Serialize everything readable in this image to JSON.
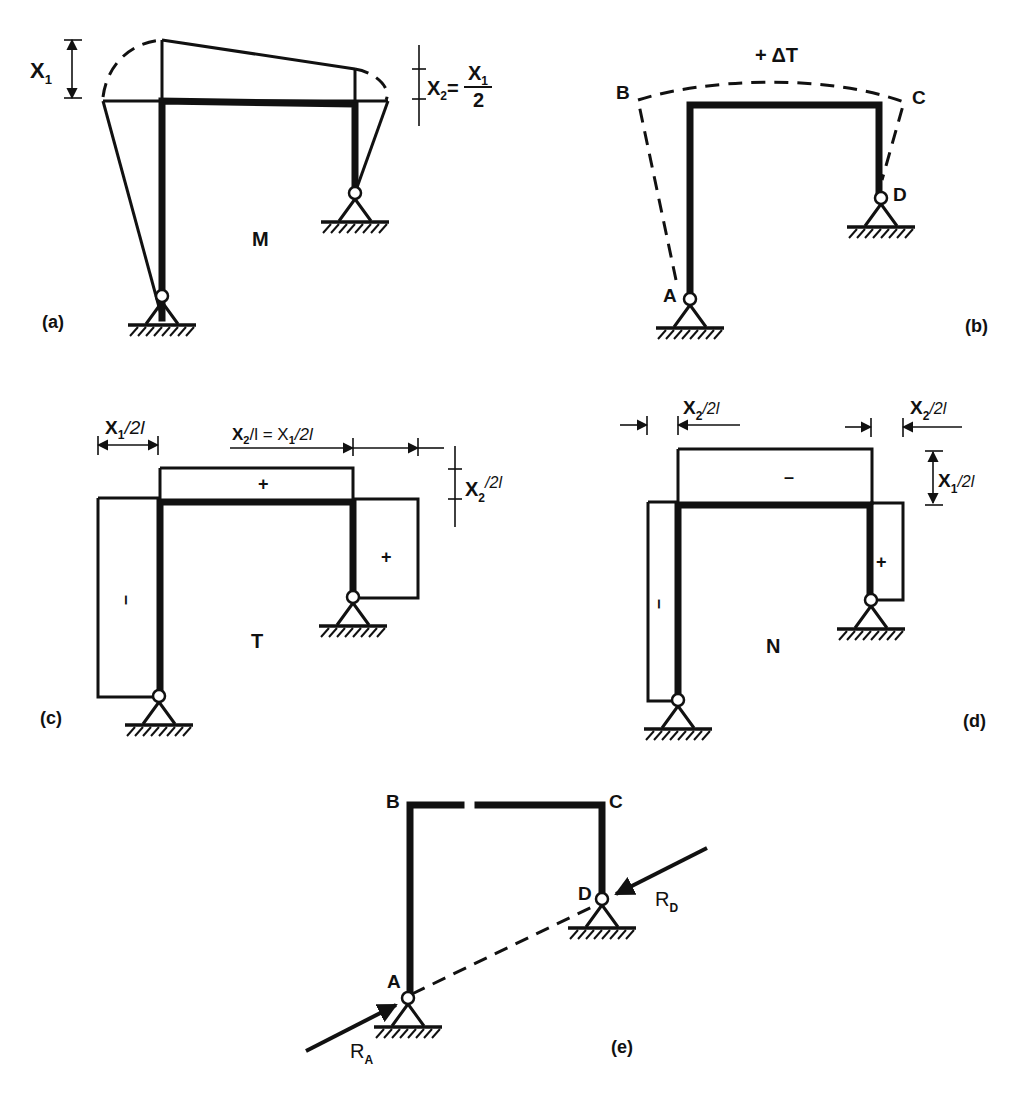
{
  "figure": {
    "panels": {
      "a": {
        "caption": "(a)",
        "diagram_label": "M",
        "dim_x1": "X",
        "dim_x1_sub": "1",
        "dim_x2": "X",
        "dim_x2_sub": "2",
        "dim_x2_eq": "=",
        "dim_x2_num": "X",
        "dim_x2_num_sub": "1",
        "dim_x2_den": "2"
      },
      "b": {
        "caption": "(b)",
        "load_label": "+ ΔT",
        "node_b": "B",
        "node_c": "C",
        "node_d": "D",
        "node_a": "A"
      },
      "c": {
        "caption": "(c)",
        "diagram_label": "T",
        "dim_left_x": "X",
        "dim_left_sub": "1",
        "dim_left_rest": "/2l",
        "dim_top_x2": "X",
        "dim_top_x2_sub": "2",
        "dim_top_mid": "/l = X",
        "dim_top_x1_sub": "1",
        "dim_top_rest": "/2l",
        "dim_right_x": "X",
        "dim_right_sub": "2",
        "dim_right_rest": "/2l",
        "sign_beam": "+",
        "sign_left_col": "–",
        "sign_right_col": "+"
      },
      "d": {
        "caption": "(d)",
        "diagram_label": "N",
        "dim_left_x": "X",
        "dim_left_sub": "2",
        "dim_left_rest": "/2l",
        "dim_right_x": "X",
        "dim_right_sub": "2",
        "dim_right_rest": "/2l",
        "dim_vert_x": "X",
        "dim_vert_sub": "1",
        "dim_vert_rest": "/2l",
        "sign_beam": "–",
        "sign_left_col": "–",
        "sign_right_col": "+"
      },
      "e": {
        "caption": "(e)",
        "node_b": "B",
        "node_c": "C",
        "node_d": "D",
        "node_a": "A",
        "reaction_a": "R",
        "reaction_a_sub": "A",
        "reaction_d": "R",
        "reaction_d_sub": "D"
      }
    }
  }
}
